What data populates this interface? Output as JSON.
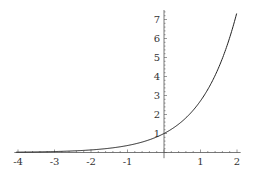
{
  "chart_data": {
    "type": "line",
    "title": "",
    "xlabel": "",
    "ylabel": "",
    "function": "exp(x)",
    "xlim": [
      -4,
      2.05
    ],
    "ylim": [
      0,
      7.5
    ],
    "x_ticks": [
      -4,
      -3,
      -2,
      -1,
      1,
      2
    ],
    "x_tick_labels": [
      "-4",
      "-3",
      "-2",
      "-1",
      "1",
      "2"
    ],
    "y_ticks": [
      1,
      2,
      3,
      4,
      5,
      6,
      7
    ],
    "y_tick_labels": [
      "1",
      "2",
      "3",
      "4",
      "5",
      "6",
      "7"
    ],
    "grid": false,
    "legend": null,
    "series": [
      {
        "name": "y = e^x",
        "x": [
          -4,
          -3,
          -2,
          -1,
          0,
          0.5,
          1,
          1.5,
          2
        ],
        "y": [
          0.018,
          0.05,
          0.135,
          0.368,
          1.0,
          1.649,
          2.718,
          4.482,
          7.389
        ]
      }
    ],
    "colors": {
      "axis": "#555555",
      "curve": "#222222"
    }
  }
}
